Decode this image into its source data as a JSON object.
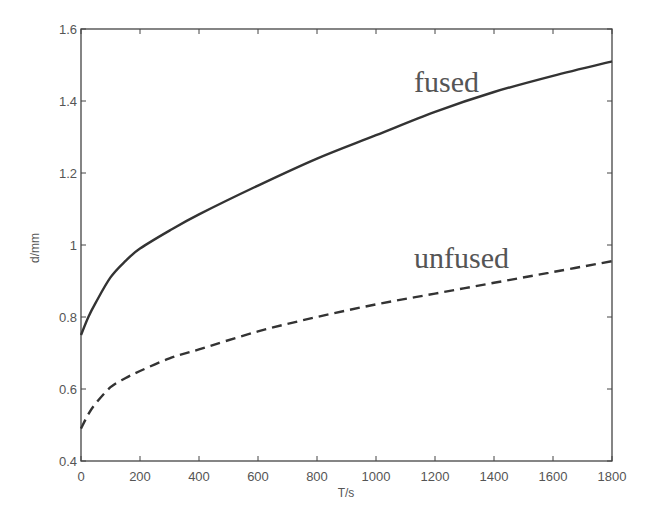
{
  "chart_data": {
    "type": "line",
    "title": "",
    "xlabel": "T/s",
    "ylabel": "d/mm",
    "xlim": [
      0,
      1800
    ],
    "ylim": [
      0.4,
      1.6
    ],
    "xticks": [
      0,
      200,
      400,
      600,
      800,
      1000,
      1200,
      1400,
      1600,
      1800
    ],
    "yticks": [
      0.4,
      0.6,
      0.8,
      1,
      1.2,
      1.4,
      1.6
    ],
    "xtick_labels": [
      "0",
      "200",
      "400",
      "600",
      "800",
      "1000",
      "1200",
      "1400",
      "1600",
      "1800"
    ],
    "ytick_labels": [
      "0.4",
      "0.6",
      "0.8",
      "1",
      "1.2",
      "1.4",
      "1.6"
    ],
    "grid": false,
    "legend": "inline annotations",
    "series": [
      {
        "name": "fused",
        "style": "solid",
        "color": "#333333",
        "x": [
          0,
          25,
          50,
          100,
          150,
          200,
          300,
          400,
          600,
          800,
          1000,
          1200,
          1400,
          1600,
          1800
        ],
        "values": [
          0.75,
          0.8,
          0.84,
          0.91,
          0.955,
          0.99,
          1.04,
          1.085,
          1.165,
          1.24,
          1.305,
          1.37,
          1.425,
          1.47,
          1.51
        ]
      },
      {
        "name": "unfused",
        "style": "dashed",
        "color": "#333333",
        "x": [
          0,
          25,
          50,
          100,
          150,
          200,
          300,
          400,
          600,
          800,
          1000,
          1200,
          1400,
          1600,
          1800
        ],
        "values": [
          0.49,
          0.53,
          0.56,
          0.605,
          0.63,
          0.65,
          0.685,
          0.71,
          0.76,
          0.8,
          0.835,
          0.865,
          0.895,
          0.925,
          0.955
        ]
      }
    ],
    "annotations": [
      {
        "text": "fused",
        "x": 1130,
        "y": 1.43
      },
      {
        "text": "unfused",
        "x": 1130,
        "y": 0.95
      }
    ]
  }
}
